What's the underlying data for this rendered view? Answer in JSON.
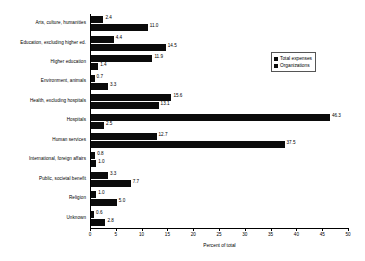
{
  "chart_data": {
    "type": "bar",
    "orientation": "horizontal",
    "title": "",
    "subtitle": "",
    "xlabel": "Percent of total",
    "ylabel": "",
    "xlim": [
      0,
      50
    ],
    "xticks": [
      0,
      5,
      10,
      15,
      20,
      25,
      30,
      35,
      40,
      45,
      50
    ],
    "grid": false,
    "legend_position": "upper right",
    "categories": [
      "Arts, culture, humanities",
      "Education, excluding higher ed.",
      "Higher education",
      "Environment, animals",
      "Health, excluding hospitals",
      "Hospitals",
      "Human services",
      "International, foreign affairs",
      "Public, societal benefit",
      "Religion",
      "Unknown"
    ],
    "series": [
      {
        "name": "Total expenses",
        "color": "#0b0b0b",
        "values": [
          2.4,
          4.4,
          11.9,
          0.7,
          15.6,
          46.3,
          12.7,
          0.8,
          3.3,
          1.0,
          0.6
        ]
      },
      {
        "name": "Organizations",
        "color": "#0b0b0b",
        "values": [
          11.0,
          14.5,
          1.4,
          3.3,
          13.1,
          2.5,
          37.5,
          1.0,
          7.7,
          5.0,
          2.8
        ]
      }
    ]
  },
  "legend": {
    "items": [
      {
        "label": "Total expenses"
      },
      {
        "label": "Organizations"
      }
    ]
  }
}
